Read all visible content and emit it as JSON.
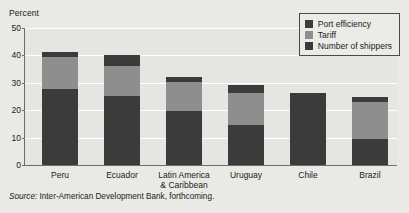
{
  "chart_data": {
    "type": "bar",
    "subtype": "stacked-bar",
    "title": "",
    "xlabel": "",
    "ylabel": "Percent",
    "ylim": [
      0,
      50
    ],
    "yticks": [
      0,
      10,
      20,
      30,
      40,
      50
    ],
    "grid": true,
    "legend_position": "top-right",
    "categories": [
      "Peru",
      "Ecuador",
      "Latin America\n& Caribbean",
      "Uruguay",
      "Chile",
      "Brazil"
    ],
    "series": [
      {
        "name": "Number of shippers",
        "color": "#3b3b3b",
        "values": [
          27.8,
          25.3,
          19.8,
          14.5,
          26.3,
          9.4
        ]
      },
      {
        "name": "Tariff",
        "color": "#8e8e8e",
        "values": [
          11.6,
          10.8,
          10.4,
          11.8,
          0.0,
          13.5
        ]
      },
      {
        "name": "Port efficiency",
        "color": "#3b3b3b",
        "values": [
          2.0,
          3.9,
          1.9,
          2.9,
          0.0,
          1.9
        ]
      }
    ],
    "totals": [
      41.4,
      40.0,
      32.1,
      29.2,
      26.3,
      24.8
    ],
    "source": "Source: Inter-American Development Bank, forthcoming."
  },
  "axis": {
    "y_title": "Percent",
    "tick_labels": [
      "50",
      "40",
      "30",
      "20",
      "10",
      "0"
    ]
  },
  "legend": {
    "items": [
      {
        "label": "Port efficiency",
        "color": "#3b3b3b"
      },
      {
        "label": "Tariff",
        "color": "#8e8e8e"
      },
      {
        "label": "Number of shippers",
        "color": "#3b3b3b"
      }
    ]
  },
  "footer": {
    "source_word": "Source:",
    "source_text": " Inter-American Development Bank, forthcoming."
  }
}
